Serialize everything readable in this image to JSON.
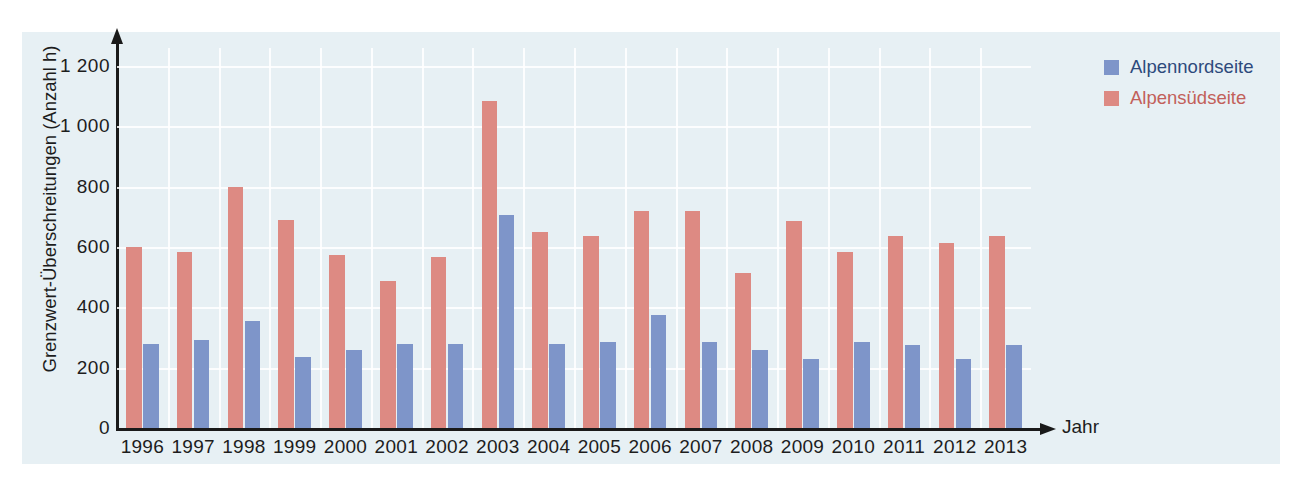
{
  "chart_data": {
    "type": "bar",
    "title": "",
    "xlabel": "Jahr",
    "ylabel": "Grenzwert-Überschreitungen (Anzahl h)",
    "categories": [
      "1996",
      "1997",
      "1998",
      "1999",
      "2000",
      "2001",
      "2002",
      "2003",
      "2004",
      "2005",
      "2006",
      "2007",
      "2008",
      "2009",
      "2010",
      "2011",
      "2012",
      "2013"
    ],
    "series": [
      {
        "name": "Alpennordseite",
        "color": "#7e95c9",
        "values": [
          280,
          293,
          355,
          235,
          260,
          280,
          280,
          705,
          280,
          285,
          375,
          285,
          258,
          230,
          285,
          275,
          230,
          275
        ]
      },
      {
        "name": "Alpensüdseite",
        "color": "#dd8a83",
        "values": [
          600,
          585,
          800,
          690,
          573,
          488,
          568,
          1085,
          650,
          638,
          720,
          720,
          513,
          685,
          583,
          638,
          612,
          638
        ]
      }
    ],
    "series_draw_order": [
      "Alpensüdseite",
      "Alpennordseite"
    ],
    "ylim": [
      0,
      1260
    ],
    "yticks": [
      0,
      200,
      400,
      600,
      800,
      1000,
      1200
    ],
    "ytick_labels": [
      "0",
      "200",
      "400",
      "600",
      "800",
      "1 000",
      "1 200"
    ],
    "grid": true,
    "grid_color": "#ffffff",
    "legend_position": "right-top",
    "panel_background": "#e7f0f4",
    "axis_color": "#1a1a1a"
  },
  "legend": {
    "entries": [
      {
        "label": "Alpennordseite",
        "color": "#7e95c9",
        "text_color": "#2d4a7c"
      },
      {
        "label": "Alpensüdseite",
        "color": "#dd8a83",
        "text_color": "#c2605a"
      }
    ]
  }
}
